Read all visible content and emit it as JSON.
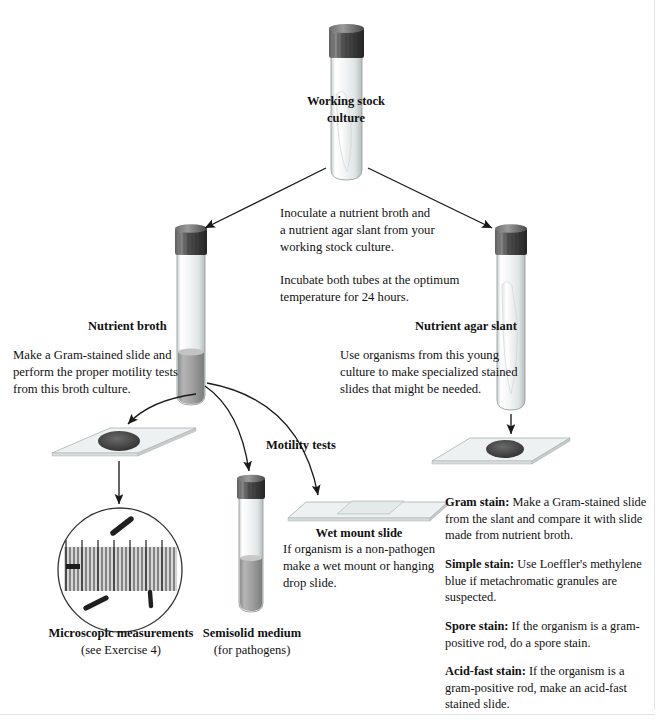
{
  "figure": {
    "type": "laboratory-flowchart",
    "topic": "Routine culture and staining workflow",
    "faint_header": ""
  },
  "nodes": {
    "stock_culture": {
      "label_line1": "Working stock",
      "label_line2": "culture",
      "vessel": "agar-slant-tube"
    },
    "nutrient_broth": {
      "label": "Nutrient broth",
      "vessel": "broth-tube"
    },
    "nutrient_agar_slant": {
      "label": "Nutrient agar slant",
      "vessel": "agar-slant-tube"
    },
    "semisolid": {
      "label_line1": "Semisolid medium",
      "label_line2": "(for pathogens)",
      "vessel": "semisolid-tube"
    },
    "wet_mount": {
      "label": "Wet mount slide",
      "vessel": "slide-stack"
    },
    "microscope": {
      "label_line1": "Microscopic measurements",
      "label_line2": "(see Exercise 4)",
      "vessel": "microscope-field"
    },
    "stained_slide_left": {
      "vessel": "microscope-slide"
    },
    "stained_slide_right": {
      "vessel": "microscope-slide"
    }
  },
  "instructions": {
    "inoculate": [
      "Inoculate a nutrient broth and",
      "a nutrient agar slant from your",
      "working stock culture."
    ],
    "incubate": [
      "Incubate both tubes at the optimum",
      "temperature for 24 hours."
    ],
    "broth_use": [
      "Make a Gram-stained slide and",
      "perform the proper motility tests",
      "from this broth culture."
    ],
    "slant_use": [
      "Use organisms from this young",
      "culture to make specialized stained",
      "slides that might be needed."
    ],
    "wet_mount_use": [
      "If organism is a non-pathogen",
      "make a wet mount or hanging",
      "drop slide."
    ],
    "motility_label": "Motility tests"
  },
  "stains": [
    {
      "name": "Gram stain:",
      "lines": [
        " Make a Gram-stained slide",
        "from the slant and compare it with slide",
        "made from nutrient broth."
      ]
    },
    {
      "name": "Simple stain:",
      "lines": [
        " Use Loeffler's methylene",
        "blue if metachromatic granules are",
        "suspected."
      ]
    },
    {
      "name": "Spore stain:",
      "lines": [
        " If the organism is a gram-",
        "positive rod, do a spore stain."
      ]
    },
    {
      "name": "Acid-fast stain:",
      "lines": [
        " If the organism is a",
        "gram-positive rod, make an acid-fast",
        "stained slide."
      ]
    }
  ],
  "colors": {
    "cap": "#4a4a4a",
    "cap_dark": "#2e2e2e",
    "glass": "#f4f6f6",
    "glass_edge": "#b9c0c0",
    "broth": "#9b9b9b",
    "agar": "#fbfbfb",
    "smear": "#4b4b4b",
    "slide": "#eef1f1",
    "arrow": "#1a1a1a",
    "text": "#111111"
  }
}
